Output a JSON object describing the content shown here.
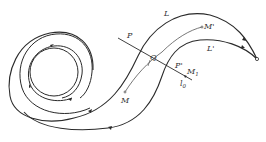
{
  "diagram": {
    "type": "phase-portrait",
    "colors": {
      "stroke": "#2a2a2a",
      "background": "#ffffff"
    },
    "labels": {
      "L": "L",
      "L_prime": "L'",
      "M": "M",
      "M_prime": "M'",
      "M1": "M",
      "M1_sub": "1",
      "P": "P",
      "P_prime": "P'",
      "Q": "Q",
      "l0": "l",
      "l0_sub": "0"
    },
    "elements": [
      "limit-cycle (inner circle)",
      "spiral trajectories",
      "trajectory L",
      "trajectory L'",
      "transversal segment l0",
      "arc M to M'",
      "singular point (endpoint)"
    ]
  }
}
